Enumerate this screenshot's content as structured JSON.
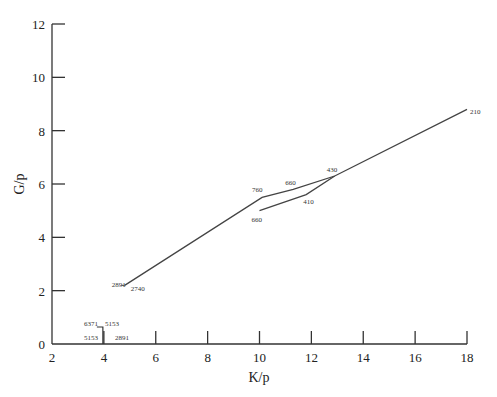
{
  "chart_data": {
    "type": "line",
    "title": "",
    "xlabel": "K/p",
    "ylabel": "G/p",
    "xlim": [
      2,
      18
    ],
    "ylim": [
      0,
      12
    ],
    "xticks": [
      2,
      4,
      6,
      8,
      10,
      12,
      14,
      16,
      18
    ],
    "yticks": [
      0,
      2,
      4,
      6,
      8,
      10,
      12
    ],
    "grid": false,
    "legend": null,
    "series": [
      {
        "name": "main path",
        "points": [
          {
            "x": 4.8,
            "y": 2.2,
            "label": "2740"
          },
          {
            "x": 10.1,
            "y": 5.5,
            "label": "760"
          },
          {
            "x": 11.3,
            "y": 5.8,
            "label": "660"
          },
          {
            "x": 12.9,
            "y": 6.3,
            "label": "430"
          },
          {
            "x": 18.0,
            "y": 8.8,
            "label": "210"
          }
        ]
      },
      {
        "name": "branch path",
        "points": [
          {
            "x": 10.0,
            "y": 5.0,
            "label": "660"
          },
          {
            "x": 11.8,
            "y": 5.6,
            "label": "410"
          },
          {
            "x": 12.9,
            "y": 6.3,
            "label": ""
          }
        ]
      }
    ],
    "annotations": [
      {
        "text": "2891",
        "x": 4.8,
        "y": 2.2
      },
      {
        "text": "6371",
        "x": 3.6,
        "y": 0.65
      },
      {
        "text": "5153",
        "x": 4.3,
        "y": 0.65
      },
      {
        "text": "5153",
        "x": 3.6,
        "y": 0.15
      },
      {
        "text": "2891",
        "x": 4.7,
        "y": 0.15
      }
    ],
    "x_axis_ticks_direction": "up",
    "y_axis_ticks_direction": "right"
  }
}
